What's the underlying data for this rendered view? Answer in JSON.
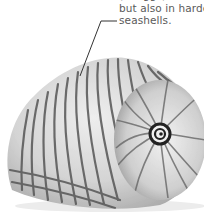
{
  "caption": {
    "lines": [
      "(in eggs)",
      "but also in harder",
      "seashells."
    ]
  },
  "illustration": {
    "subject": "seashell",
    "icon": "seashell-illustration",
    "leader_line_color": "#333333",
    "stripe_color": "#555555",
    "shell_base_color": "#d9d9d9"
  }
}
